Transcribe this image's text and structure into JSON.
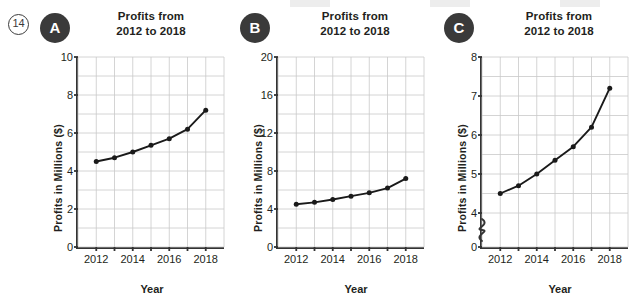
{
  "question_number": "14",
  "x_axis_label": "Year",
  "y_axis_label": "Profits in Millions ($)",
  "title_line1": "Profits from",
  "title_line2": "2012 to 2018",
  "panels": [
    {
      "badge": "A",
      "ymin": 0,
      "ymax": 10,
      "tick_step": 2,
      "grid_step": 1,
      "broken_axis": false
    },
    {
      "badge": "B",
      "ymin": 0,
      "ymax": 20,
      "tick_step": 4,
      "grid_step": 2,
      "broken_axis": false
    },
    {
      "badge": "C",
      "ymin": 4,
      "ymax": 8,
      "tick_step": 1,
      "grid_step": 0.5,
      "broken_axis": true
    }
  ],
  "chart_data": [
    {
      "type": "line",
      "title": "Profits from 2012 to 2018",
      "xlabel": "Year",
      "ylabel": "Profits in Millions ($)",
      "panel": "A",
      "x": [
        2012,
        2013,
        2014,
        2015,
        2016,
        2017,
        2018
      ],
      "values": [
        4.5,
        4.7,
        5.0,
        5.35,
        5.7,
        6.2,
        7.2
      ],
      "xtick_labels": [
        "2012",
        "2014",
        "2016",
        "2018"
      ],
      "ytick_labels": [
        "0",
        "2",
        "4",
        "6",
        "8",
        "10"
      ],
      "ylim": [
        0,
        10
      ],
      "xlim": [
        2011,
        2019
      ],
      "grid": true,
      "legend": "none",
      "broken_axis": false
    },
    {
      "type": "line",
      "title": "Profits from 2012 to 2018",
      "xlabel": "Year",
      "ylabel": "Profits in Millions ($)",
      "panel": "B",
      "x": [
        2012,
        2013,
        2014,
        2015,
        2016,
        2017,
        2018
      ],
      "values": [
        4.5,
        4.7,
        5.0,
        5.35,
        5.7,
        6.2,
        7.2
      ],
      "xtick_labels": [
        "2012",
        "2014",
        "2016",
        "2018"
      ],
      "ytick_labels": [
        "0",
        "4",
        "8",
        "12",
        "16",
        "20"
      ],
      "ylim": [
        0,
        20
      ],
      "xlim": [
        2011,
        2019
      ],
      "grid": true,
      "legend": "none",
      "broken_axis": false
    },
    {
      "type": "line",
      "title": "Profits from 2012 to 2018",
      "xlabel": "Year",
      "ylabel": "Profits in Millions ($)",
      "panel": "C",
      "x": [
        2012,
        2013,
        2014,
        2015,
        2016,
        2017,
        2018
      ],
      "values": [
        4.5,
        4.7,
        5.0,
        5.35,
        5.7,
        6.2,
        7.2
      ],
      "xtick_labels": [
        "2012",
        "2014",
        "2016",
        "2018"
      ],
      "ytick_labels": [
        "0",
        "4",
        "5",
        "6",
        "7",
        "8"
      ],
      "ylim": [
        4,
        8
      ],
      "xlim": [
        2011,
        2019
      ],
      "grid": true,
      "legend": "none",
      "broken_axis": true
    }
  ]
}
